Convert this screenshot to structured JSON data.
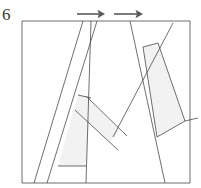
{
  "figure": {
    "label": "6",
    "caption": "",
    "background_color": "#ffffff",
    "stroke_color": "#4a4a4a",
    "stroke_width": 0.8,
    "shade_color": "#f2f2f2",
    "arrow_color": "#5a5a5a",
    "canvas": {
      "width": 201,
      "height": 188
    }
  },
  "arrows": [
    {
      "name": "arrow-left",
      "direction": "right",
      "x1": 77,
      "y1": 14,
      "x2": 105,
      "y2": 14,
      "head_size": 5
    },
    {
      "name": "arrow-right",
      "direction": "right",
      "x1": 114,
      "y1": 14,
      "x2": 143,
      "y2": 14,
      "head_size": 5
    }
  ],
  "frame": {
    "name": "bounding-box",
    "points": "22,21 190,21 190,183 22,183"
  },
  "shaded_pieces": [
    {
      "name": "shaded-piece-left-lower",
      "points": "78,95 91,98 86,166 58,166"
    },
    {
      "name": "shaded-piece-center-band",
      "points": "86,96 120,130 110,142 75,110"
    },
    {
      "name": "shaded-piece-right-strip",
      "points": "143,47 158,43 185,121 157,137"
    }
  ],
  "lines": [
    {
      "name": "line-left-slant-outer",
      "x1": 83,
      "y1": 21,
      "x2": 34,
      "y2": 183
    },
    {
      "name": "line-left-slant-inner",
      "x1": 97,
      "y1": 21,
      "x2": 47,
      "y2": 183
    },
    {
      "name": "line-left-vertical",
      "x1": 91,
      "y1": 21,
      "x2": 86,
      "y2": 183
    },
    {
      "name": "line-center-long-diagonal",
      "x1": 130,
      "y1": 21,
      "x2": 165,
      "y2": 183
    },
    {
      "name": "line-upper-right-diagonal",
      "x1": 173,
      "y1": 23,
      "x2": 113,
      "y2": 137
    },
    {
      "name": "line-band-upper",
      "x1": 86,
      "y1": 96,
      "x2": 127,
      "y2": 136
    },
    {
      "name": "line-band-lower",
      "x1": 75,
      "y1": 110,
      "x2": 118,
      "y2": 150
    },
    {
      "name": "line-band-cap",
      "x1": 78,
      "y1": 95,
      "x2": 91,
      "y2": 98
    },
    {
      "name": "line-left-foot",
      "x1": 58,
      "y1": 166,
      "x2": 86,
      "y2": 166
    },
    {
      "name": "line-right-strip-top",
      "x1": 143,
      "y1": 47,
      "x2": 158,
      "y2": 43
    },
    {
      "name": "line-right-strip-left",
      "x1": 143,
      "y1": 47,
      "x2": 157,
      "y2": 137
    },
    {
      "name": "line-right-strip-right",
      "x1": 158,
      "y1": 43,
      "x2": 185,
      "y2": 121
    },
    {
      "name": "line-right-strip-bottom",
      "x1": 157,
      "y1": 137,
      "x2": 185,
      "y2": 121
    },
    {
      "name": "line-right-edge-tail",
      "x1": 185,
      "y1": 121,
      "x2": 198,
      "y2": 118
    }
  ]
}
